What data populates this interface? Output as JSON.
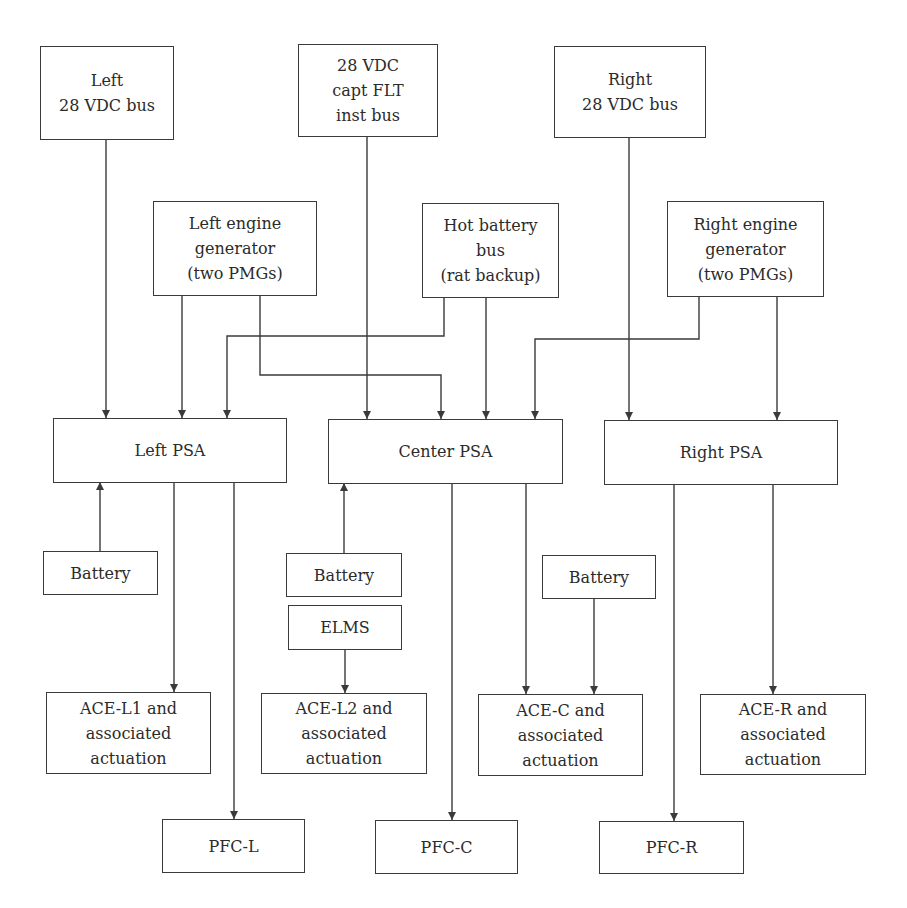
{
  "diagram": {
    "nodes": {
      "left_bus": {
        "label": "Left\n28 VDC bus"
      },
      "capt_bus": {
        "label": "28 VDC\ncapt FLT\ninst bus"
      },
      "right_bus": {
        "label": "Right\n28 VDC bus"
      },
      "left_gen": {
        "label": "Left engine\ngenerator\n(two PMGs)"
      },
      "hot_batt": {
        "label": "Hot battery\nbus\n(rat backup)"
      },
      "right_gen": {
        "label": "Right engine\ngenerator\n(two PMGs)"
      },
      "left_psa": {
        "label": "Left PSA"
      },
      "center_psa": {
        "label": "Center PSA"
      },
      "right_psa": {
        "label": "Right PSA"
      },
      "battery_left": {
        "label": "Battery"
      },
      "battery_center": {
        "label": "Battery"
      },
      "elms": {
        "label": "ELMS"
      },
      "battery_right": {
        "label": "Battery"
      },
      "ace_l1": {
        "label": "ACE-L1 and\nassociated\nactuation"
      },
      "ace_l2": {
        "label": "ACE-L2 and\nassociated\nactuation"
      },
      "ace_c": {
        "label": "ACE-C and\nassociated\nactuation"
      },
      "ace_r": {
        "label": "ACE-R and\nassociated\nactuation"
      },
      "pfc_l": {
        "label": "PFC-L"
      },
      "pfc_c": {
        "label": "PFC-C"
      },
      "pfc_r": {
        "label": "PFC-R"
      }
    },
    "edges": [
      {
        "from": "Left 28 VDC bus",
        "to": "Left PSA"
      },
      {
        "from": "Left engine generator",
        "to": "Left PSA"
      },
      {
        "from": "Hot battery bus",
        "to": "Left PSA"
      },
      {
        "from": "Left engine generator",
        "to": "Center PSA"
      },
      {
        "from": "28 VDC capt FLT inst bus",
        "to": "Center PSA"
      },
      {
        "from": "Hot battery bus",
        "to": "Center PSA"
      },
      {
        "from": "Right engine generator",
        "to": "Center PSA"
      },
      {
        "from": "Right 28 VDC bus",
        "to": "Right PSA"
      },
      {
        "from": "Right engine generator",
        "to": "Right PSA"
      },
      {
        "from": "Battery (left)",
        "to": "Left PSA"
      },
      {
        "from": "Battery (center)",
        "to": "Center PSA"
      },
      {
        "from": "Left PSA",
        "to": "ACE-L1"
      },
      {
        "from": "Left PSA",
        "to": "PFC-L"
      },
      {
        "from": "ELMS",
        "to": "ACE-L2"
      },
      {
        "from": "Center PSA",
        "to": "PFC-C"
      },
      {
        "from": "Center PSA",
        "to": "ACE-C"
      },
      {
        "from": "Battery (right)",
        "to": "ACE-C"
      },
      {
        "from": "Right PSA",
        "to": "PFC-R"
      },
      {
        "from": "Right PSA",
        "to": "ACE-R"
      }
    ],
    "colors": {
      "line": "#3a3a3a",
      "text": "#2b2b2b",
      "background": "#ffffff"
    }
  }
}
